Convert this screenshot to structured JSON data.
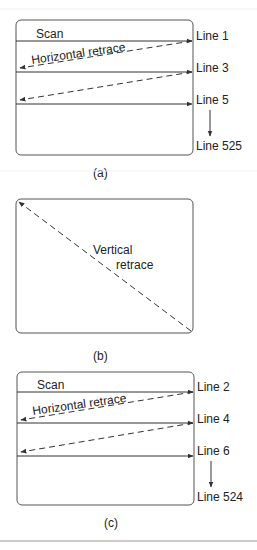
{
  "panels": [
    {
      "id": "a",
      "caption": "(a)",
      "scan_label": "Scan",
      "retrace_label": "Horizontal retrace",
      "line_labels": [
        "Line 1",
        "Line 3",
        "Line 5",
        "Line 525"
      ]
    },
    {
      "id": "b",
      "caption": "(b)",
      "retrace_label_line1": "Vertical",
      "retrace_label_line2": "retrace"
    },
    {
      "id": "c",
      "caption": "(c)",
      "scan_label": "Scan",
      "retrace_label": "Horizontal retrace",
      "line_labels": [
        "Line 2",
        "Line 4",
        "Line 6",
        "Line 524"
      ]
    }
  ],
  "colors": {
    "stroke": "#333333",
    "text": "#222222",
    "rule": "#bbbbbb"
  }
}
